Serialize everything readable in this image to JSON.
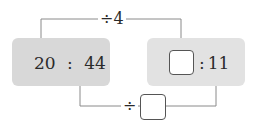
{
  "diagram": {
    "left_ratio": {
      "a": "20",
      "sep": ":",
      "b": "44"
    },
    "right_ratio": {
      "a_blank": "",
      "sep": ":",
      "b": "11"
    },
    "top_operation": {
      "label": "÷4"
    },
    "bottom_operation": {
      "symbol": "÷",
      "blank": ""
    },
    "colors": {
      "left_box": "#d8d8d8",
      "right_box": "#e2e2e2",
      "connector": "#8a8a8a"
    }
  }
}
